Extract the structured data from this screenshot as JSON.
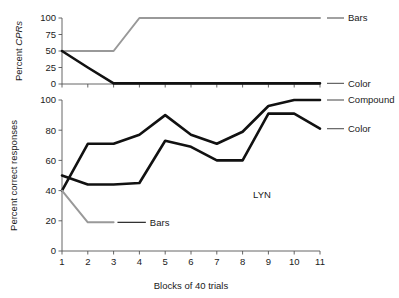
{
  "figure": {
    "subject_annotation": "LYN",
    "xlabel": "Blocks of 40 trials",
    "colors": {
      "series_dark": "#111111",
      "series_gray": "#999999",
      "axis": "#555555",
      "text": "#1a1a1a"
    }
  },
  "chart_data": [
    {
      "id": "top",
      "type": "line",
      "title": "",
      "xlabel": "",
      "ylabel": "Percent CPRs",
      "ylabel_plain": "Percent ",
      "ylabel_italic": "CPRs",
      "x": [
        1,
        2,
        3,
        4,
        5,
        6,
        7,
        8,
        9,
        10,
        11
      ],
      "xlim": [
        1,
        11
      ],
      "ylim": [
        0,
        100
      ],
      "yticks": [
        0,
        25,
        50,
        75,
        100
      ],
      "ytick_labels": [
        "0",
        "25",
        "50",
        "75",
        "100"
      ],
      "xticks": [
        1,
        2,
        3,
        4,
        5,
        6,
        7,
        8,
        9,
        10,
        11
      ],
      "xtick_labels": [
        "",
        "",
        "",
        "",
        "",
        "",
        "",
        "",
        "",
        "",
        ""
      ],
      "grid": false,
      "legend_position": "right-outside",
      "series": [
        {
          "name": "Bars",
          "color": "#999999",
          "width": 2.0,
          "values": [
            50,
            50,
            50,
            100,
            100,
            100,
            100,
            100,
            100,
            100,
            100
          ]
        },
        {
          "name": "Color",
          "color": "#111111",
          "width": 2.6,
          "values": [
            50,
            25,
            1,
            1,
            1,
            1,
            1,
            1,
            1,
            1,
            1
          ]
        }
      ]
    },
    {
      "id": "bottom",
      "type": "line",
      "title": "",
      "xlabel": "Blocks of 40 trials",
      "ylabel": "Percent correct responses",
      "x": [
        1,
        2,
        3,
        4,
        5,
        6,
        7,
        8,
        9,
        10,
        11
      ],
      "xlim": [
        1,
        11
      ],
      "ylim": [
        0,
        100
      ],
      "yticks": [
        0,
        20,
        40,
        60,
        80,
        100
      ],
      "ytick_labels": [
        "0",
        "20",
        "40",
        "60",
        "80",
        "100"
      ],
      "xticks": [
        1,
        2,
        3,
        4,
        5,
        6,
        7,
        8,
        9,
        10,
        11
      ],
      "xtick_labels": [
        "1",
        "2",
        "3",
        "4",
        "5",
        "6",
        "7",
        "8",
        "9",
        "10",
        "11"
      ],
      "grid": false,
      "legend_position": "right-outside",
      "series": [
        {
          "name": "Compound",
          "color": "#111111",
          "width": 2.6,
          "values": [
            40,
            71,
            71,
            77,
            90,
            77,
            71,
            79,
            96,
            100,
            100
          ]
        },
        {
          "name": "Color",
          "color": "#111111",
          "width": 2.6,
          "values": [
            50,
            44,
            44,
            45,
            73,
            69,
            60,
            60,
            91,
            91,
            81
          ]
        },
        {
          "name": "Bars",
          "color": "#999999",
          "width": 2.0,
          "values": [
            40,
            19,
            19,
            null,
            null,
            null,
            null,
            null,
            null,
            null,
            null
          ]
        }
      ]
    }
  ],
  "legends": {
    "top": [
      {
        "label": "Bars",
        "color": "#999999",
        "y_value": 100
      },
      {
        "label": "Color",
        "color": "#111111",
        "y_value": 1
      }
    ],
    "bottom": [
      {
        "label": "Compound",
        "color": "#111111",
        "y_value": 100
      },
      {
        "label": "Color",
        "color": "#111111",
        "y_value": 81
      },
      {
        "label": "Bars",
        "color": "#999999",
        "y_value": 19,
        "inline": true
      }
    ]
  }
}
